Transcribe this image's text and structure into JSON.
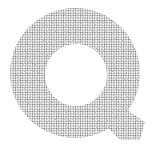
{
  "image": {
    "glyph": "Q",
    "style": "stippled-halftone",
    "background": "#ffffff",
    "dot_color": "#6e6e6e"
  }
}
